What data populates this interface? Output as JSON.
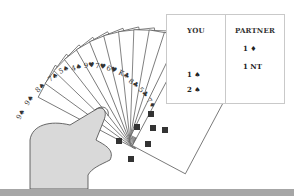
{
  "bidding_table": {
    "columns": [
      {
        "header": "YOU",
        "bids": [
          "",
          "1 ♠",
          "2 ♠"
        ]
      },
      {
        "header": "PARTNER",
        "bids": [
          "1 ♦",
          "1 NT",
          ""
        ]
      }
    ]
  },
  "hand": {
    "cards": [
      {
        "rank": "9",
        "suit": "♠"
      },
      {
        "rank": "9",
        "suit": "♠"
      },
      {
        "rank": "8",
        "suit": "♠"
      },
      {
        "rank": "7",
        "suit": "♠"
      },
      {
        "rank": "5",
        "suit": "♠"
      },
      {
        "rank": "4",
        "suit": "♠"
      },
      {
        "rank": "9",
        "suit": "♥"
      },
      {
        "rank": "7",
        "suit": "♥"
      },
      {
        "rank": "6",
        "suit": "♥"
      },
      {
        "rank": "K",
        "suit": "♣"
      },
      {
        "rank": "8",
        "suit": "♣"
      },
      {
        "rank": "5",
        "suit": "♣"
      },
      {
        "rank": "7",
        "suit": "♦"
      }
    ]
  },
  "colors": {
    "bar": "#a6a6a6",
    "hand": "#d9d9d9",
    "border": "#c9c9c9"
  }
}
